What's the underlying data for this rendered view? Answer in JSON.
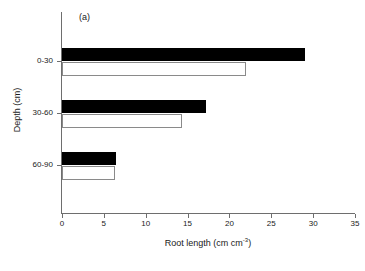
{
  "chart_data": {
    "type": "bar",
    "orientation": "horizontal",
    "title": "",
    "panel_label": "(a)",
    "xlabel_text": "Root length (cm cm",
    "xlabel_sup": "-3",
    "xlabel_tail": ")",
    "xlabel": "Root length (cm cm-3)",
    "ylabel": "Depth (cm)",
    "categories": [
      "0-30",
      "30-60",
      "60-90"
    ],
    "xlim": [
      0,
      35
    ],
    "xticks": [
      0,
      5,
      10,
      15,
      20,
      25,
      30,
      35
    ],
    "xtick_labels": [
      "0",
      "5",
      "10",
      "15",
      "20",
      "25",
      "30",
      "35"
    ],
    "grid": false,
    "legend": "none",
    "series": [
      {
        "name": "filled",
        "fill": "#000000",
        "edge": "#000000",
        "values": [
          29.0,
          17.2,
          6.4
        ]
      },
      {
        "name": "open",
        "fill": "#ffffff",
        "edge": "#8a8a8a",
        "values": [
          22.0,
          14.3,
          6.3
        ]
      }
    ]
  },
  "geometry": {
    "rows": [
      {
        "category": "0-30",
        "filled_top": 36,
        "filled_height": 13,
        "open_top": 50,
        "open_height": 14,
        "tick_y": 49
      },
      {
        "category": "30-60",
        "filled_top": 88,
        "filled_height": 13,
        "open_top": 102,
        "open_height": 14,
        "tick_y": 101
      },
      {
        "category": "60-90",
        "filled_top": 140,
        "filled_height": 13,
        "open_top": 154,
        "open_height": 14,
        "tick_y": 153
      }
    ]
  }
}
